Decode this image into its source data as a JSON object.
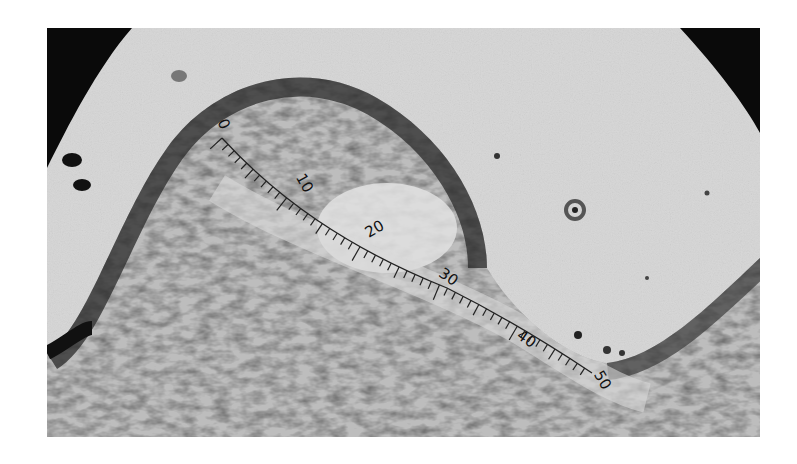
{
  "image": {
    "description": "Grayscale photomicrograph of a tissue fold with an ocular micrometer scale overlaid along its curved surface",
    "colors": {
      "background": "#d9d9d9",
      "vignette": "#0a0a0a",
      "tissue_dark": "#3a3a3a",
      "tissue_mid": "#8a8a8a",
      "tissue_light": "#c4c4c4"
    },
    "scale": {
      "labels": [
        "0",
        "10",
        "20",
        "30",
        "40",
        "50"
      ]
    },
    "features": [
      "dome-shaped tissue ridge (left)",
      "pale central region",
      "circular ring artifact (upper right)",
      "dark specks on lumen"
    ]
  }
}
